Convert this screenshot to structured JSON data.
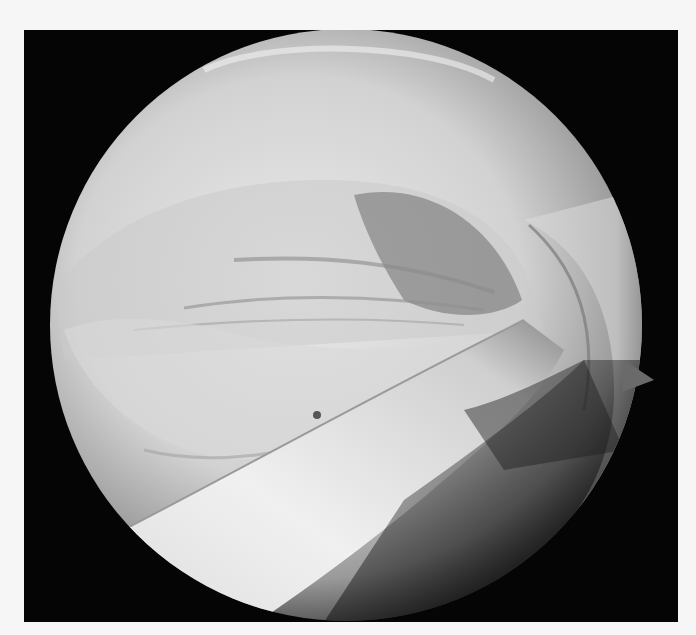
{
  "image": {
    "description": "Arthroscopic view: circular scope field of view on black background showing pale joint tissue with a curved tendon band crossing diagonally",
    "colors": {
      "background": "#f6f6f6",
      "frame": "#050505",
      "tissue_light": "#e6e6e6",
      "tissue_mid": "#bdbdbd",
      "tissue_dark": "#555555"
    }
  }
}
